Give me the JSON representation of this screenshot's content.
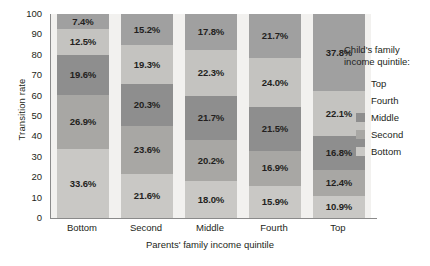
{
  "chart_data": {
    "type": "bar",
    "stacked": true,
    "title": "",
    "xlabel": "Parents' family income quintile",
    "ylabel": "Transition rate",
    "categories": [
      "Bottom",
      "Second",
      "Middle",
      "Fourth",
      "Top"
    ],
    "ylim": [
      0,
      100
    ],
    "yticks": [
      100,
      90,
      80,
      70,
      60,
      50,
      40,
      30,
      20,
      10,
      0
    ],
    "grid": false,
    "legend_position": "right",
    "legend_title": "Child's family income quintile:",
    "series": [
      {
        "name": "Top",
        "color": "#a0a0a0",
        "values": [
          7.4,
          15.2,
          17.8,
          21.7,
          37.8
        ]
      },
      {
        "name": "Fourth",
        "color": "#c4c3c0",
        "values": [
          12.5,
          19.3,
          22.3,
          24.0,
          22.1
        ]
      },
      {
        "name": "Middle",
        "color": "#8e8e8e",
        "values": [
          19.6,
          20.3,
          21.7,
          21.5,
          16.8
        ]
      },
      {
        "name": "Second",
        "color": "#a8a7a4",
        "values": [
          26.9,
          23.6,
          20.2,
          16.9,
          12.4
        ]
      },
      {
        "name": "Bottom",
        "color": "#c9c8c5",
        "values": [
          33.6,
          21.6,
          18.0,
          15.9,
          10.9
        ]
      }
    ],
    "bar_labels": {
      "Bottom": [
        "7.4%",
        "12.5%",
        "19.6%",
        "26.9%",
        "33.6%"
      ],
      "Second": [
        "15.2%",
        "19.3%",
        "20.3%",
        "23.6%",
        "21.6%"
      ],
      "Middle": [
        "17.8%",
        "22.3%",
        "21.7%",
        "20.2%",
        "18.0%"
      ],
      "Fourth": [
        "21.7%",
        "24.0%",
        "21.5%",
        "16.9%",
        "15.9%"
      ],
      "Top": [
        "37.8%",
        "22.1%",
        "16.8%",
        "12.4%",
        "10.9%"
      ]
    }
  },
  "axes": {
    "y_title": "Transition rate",
    "x_title": "Parents' family income quintile",
    "y_ticks": [
      "100",
      "90",
      "80",
      "70",
      "60",
      "50",
      "40",
      "30",
      "20",
      "10",
      "0"
    ],
    "x_ticks": [
      "Bottom",
      "Second",
      "Middle",
      "Fourth",
      "Top"
    ]
  },
  "legend": {
    "title_line1": "Child's family",
    "title_line2": "income quintile:",
    "items": [
      {
        "label": "Top",
        "color": "#a0a0a0"
      },
      {
        "label": "Fourth",
        "color": "#c4c3c0"
      },
      {
        "label": "Middle",
        "color": "#8e8e8e"
      },
      {
        "label": "Second",
        "color": "#a8a7a4"
      },
      {
        "label": "Bottom",
        "color": "#c9c8c5"
      }
    ]
  },
  "colors": {
    "panel_background": "#f2f1ef",
    "axis_line": "#8a8a8a",
    "text": "#231f20",
    "page_background": "#ffffff"
  }
}
